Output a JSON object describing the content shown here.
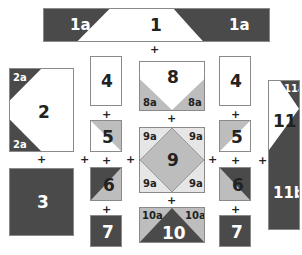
{
  "colors": {
    "dark": "#4a4a4a",
    "medium": "#bdbdbd",
    "light": "#e6e6e6",
    "white": "#ffffff",
    "border": "#8a8a8a"
  },
  "pieces": {
    "p1": {
      "label": "1",
      "corner_label_left": "1a",
      "corner_label_right": "1a"
    },
    "p2": {
      "label": "2",
      "corner_label_top": "2a",
      "corner_label_bottom": "2a"
    },
    "p3": {
      "label": "3"
    },
    "p4_left": {
      "label": "4"
    },
    "p5_left": {
      "label": "5"
    },
    "p6_left": {
      "label": "6"
    },
    "p7_left": {
      "label": "7"
    },
    "p8": {
      "label": "8",
      "corner_label_left": "8a",
      "corner_label_right": "8a"
    },
    "p9": {
      "label": "9",
      "corner_labels": [
        "9a",
        "9a",
        "9a",
        "9a"
      ]
    },
    "p10": {
      "label": "10",
      "corner_label_left": "10a",
      "corner_label_right": "10a"
    },
    "p4_right": {
      "label": "4"
    },
    "p5_right": {
      "label": "5"
    },
    "p6_right": {
      "label": "6"
    },
    "p7_right": {
      "label": "7"
    },
    "p11": {
      "label": "11",
      "corner_label_top": "11a",
      "lower_label": "11b"
    }
  },
  "join_symbol": "+",
  "caption": ""
}
